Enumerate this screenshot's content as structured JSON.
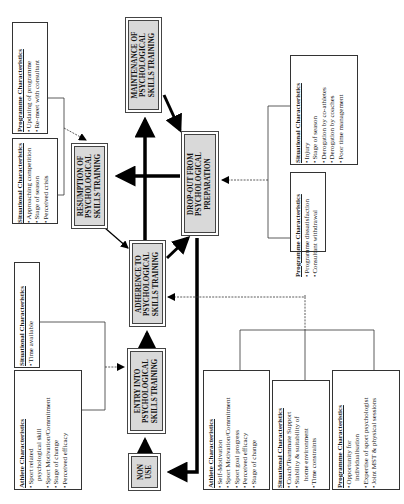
{
  "stages": {
    "maintenance": {
      "lines": [
        "MAINTENANCE OF",
        "PSYCHOLOGICAL",
        "SKILLS TRAINING"
      ]
    },
    "resumption": {
      "lines": [
        "RESUMPTION OF",
        "PSYCHOLOGICAL",
        "SKILLS TRAINING"
      ]
    },
    "dropout": {
      "lines": [
        "DROP-OUT FROM",
        "PSYCHOLOGICAL",
        "PREPARATION"
      ]
    },
    "adherence": {
      "lines": [
        "ADHERENCE TO",
        "PSYCHOLOGICAL",
        "SKILLS TRAINING"
      ]
    },
    "entry": {
      "lines": [
        "ENTRY INTO",
        "PSYCHOLOGICAL",
        "SKILLS TRAINING"
      ]
    },
    "nonuse": {
      "lines": [
        "NON",
        "USE"
      ]
    }
  },
  "characteristics": {
    "resumption_programme": {
      "title": "Programme Characteristics",
      "items": [
        "Updating of programme",
        "Re-meet with consultant"
      ]
    },
    "resumption_situational": {
      "title": "Situational Characteristics",
      "items": [
        "Approaching competition",
        "Stage of season",
        "Perceived crisis"
      ]
    },
    "entry_situational": {
      "title": "Situational Characteristics",
      "items": [
        "Time available"
      ]
    },
    "entry_athlete": {
      "title": "Athlete Characteristics",
      "items": [
        "Sport related",
        "psychological skill",
        "Sport Motivation/Commitment",
        "Stage of change",
        "Perceived efficacy"
      ]
    },
    "dropout_situational": {
      "title": "Situational Characteristics",
      "items": [
        "Injury",
        "Stage of season",
        "Derogation by co-athletes",
        "Derogation by coaches",
        "Poor time management"
      ]
    },
    "dropout_programme": {
      "title": "Programme Characteristics",
      "items": [
        "Programme dissatisfaction",
        "Consultant withdrawal"
      ]
    },
    "adherence_athlete": {
      "title": "Athlete Characteristics",
      "items": [
        "Self-Motivation",
        "Sport Motivation/Commitment",
        "Sport goal progress",
        "Perceived efficacy",
        "Stage of change"
      ]
    },
    "adherence_situational": {
      "title": "Situational Characteristics",
      "items": [
        "Coach/Teammate Support",
        "Stability & suitability of",
        "home environment",
        "Time constraints"
      ]
    },
    "adherence_programme": {
      "title": "Programme Characteristics",
      "items": [
        "Opportunity for",
        "individualisation",
        "Expertise of sport psychologist",
        "Joint MST & physical sessions"
      ]
    }
  },
  "colors": {
    "stage_fill": "#d9d9d9",
    "line": "#000000",
    "border": "#333333"
  }
}
